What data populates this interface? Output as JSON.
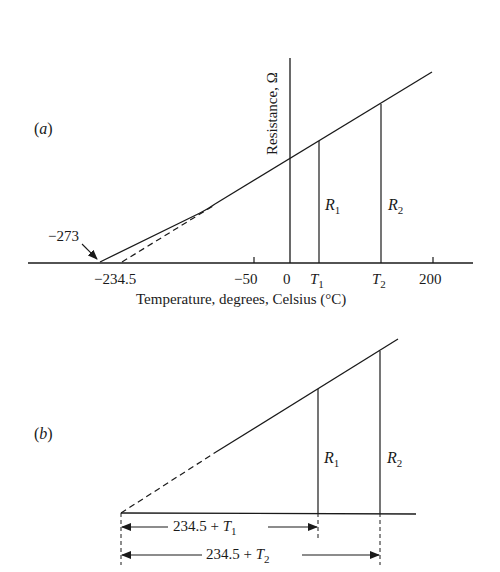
{
  "panel_a": {
    "label_open": "(",
    "label_letter": "a",
    "label_close": ")",
    "y_axis_label": "Resistance, Ω",
    "x_axis_label": "Temperature, degrees, Celsius (°C)",
    "annotation_abs_zero": "−273",
    "ticks": {
      "t_inferred_zero": "−234.5",
      "t_neg50": "−50",
      "t_zero": "0",
      "t1_letter": "T",
      "t1_sub": "1",
      "t2_letter": "T",
      "t2_sub": "2",
      "t_200": "200"
    },
    "r1_letter": "R",
    "r1_sub": "1",
    "r2_letter": "R",
    "r2_sub": "2"
  },
  "panel_b": {
    "label_open": "(",
    "label_letter": "b",
    "label_close": ")",
    "r1_letter": "R",
    "r1_sub": "1",
    "r2_letter": "R",
    "r2_sub": "2",
    "dim1_prefix": "234.5 + ",
    "dim1_letter": "T",
    "dim1_sub": "1",
    "dim2_prefix": "234.5 + ",
    "dim2_letter": "T",
    "dim2_sub": "2"
  },
  "colors": {
    "ink": "#1a1a1a",
    "background": "#ffffff"
  }
}
